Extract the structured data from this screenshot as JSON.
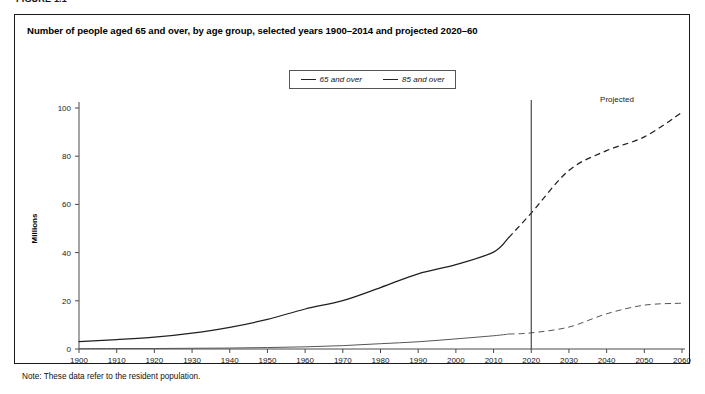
{
  "figure": {
    "number_label": "FIGURE 1.1",
    "title": "Number of people aged 65 and over, by age group, selected years 1900–2014 and projected 2020–60",
    "note": "Note: These data refer to the resident population."
  },
  "legend": {
    "items": [
      {
        "label": "65 and over",
        "style": "solid",
        "color": "#1f1f1f"
      },
      {
        "label": "85 and over",
        "style": "solid",
        "color": "#555555"
      }
    ]
  },
  "annotations": {
    "projected_label": "Projected",
    "projection_start_year": 2020
  },
  "chart_data": {
    "type": "line",
    "title": "Number of people aged 65 and over, by age group, selected years 1900–2014 and projected 2020–60",
    "xlabel": "",
    "ylabel": "Millions",
    "xlim": [
      1900,
      2060
    ],
    "ylim": [
      0,
      100
    ],
    "yticks": [
      0,
      20,
      40,
      60,
      80,
      100
    ],
    "xticks": [
      1900,
      1910,
      1920,
      1930,
      1940,
      1950,
      1960,
      1970,
      1980,
      1990,
      2000,
      2010,
      2020,
      2030,
      2040,
      2050,
      2060
    ],
    "grid": false,
    "legend_position": "top-center",
    "projection_start_year": 2020,
    "series": [
      {
        "name": "65 and over",
        "color": "#1f1f1f",
        "x": [
          1900,
          1910,
          1920,
          1930,
          1940,
          1950,
          1960,
          1970,
          1980,
          1990,
          2000,
          2010,
          2014,
          2020,
          2030,
          2040,
          2050,
          2060
        ],
        "values": [
          3.1,
          3.9,
          4.9,
          6.6,
          9.0,
          12.3,
          16.6,
          20.1,
          25.5,
          31.2,
          35.0,
          40.2,
          46.2,
          56.4,
          74.1,
          82.3,
          88.0,
          98.2
        ],
        "observed_through": 2014
      },
      {
        "name": "85 and over",
        "color": "#555555",
        "x": [
          1900,
          1910,
          1920,
          1930,
          1940,
          1950,
          1960,
          1970,
          1980,
          1990,
          2000,
          2010,
          2014,
          2020,
          2030,
          2040,
          2050,
          2060
        ],
        "values": [
          0.1,
          0.2,
          0.2,
          0.3,
          0.4,
          0.6,
          0.9,
          1.4,
          2.2,
          3.0,
          4.2,
          5.5,
          6.2,
          6.7,
          9.1,
          14.6,
          18.2,
          19.0
        ],
        "observed_through": 2014
      }
    ]
  }
}
